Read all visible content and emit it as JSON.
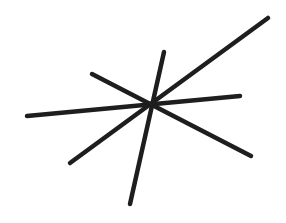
{
  "figure": {
    "description": "Four intersecting straight line segments crossing near a common point",
    "background": "#ffffff",
    "stroke_color": "#1e1e1e",
    "stroke_width": 4.5,
    "intersection": {
      "x": 152,
      "y": 103
    },
    "lines": [
      {
        "id": "line-a",
        "x1": 27,
        "y1": 116,
        "x2": 240,
        "y2": 96
      },
      {
        "id": "line-b",
        "x1": 70,
        "y1": 163,
        "x2": 268,
        "y2": 18
      },
      {
        "id": "line-c",
        "x1": 130,
        "y1": 204,
        "x2": 164,
        "y2": 52
      },
      {
        "id": "line-d",
        "x1": 92,
        "y1": 74,
        "x2": 251,
        "y2": 156
      }
    ]
  }
}
